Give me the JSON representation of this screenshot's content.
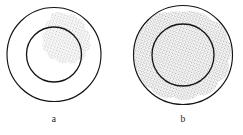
{
  "figure": {
    "type": "scientific-diagram",
    "background_color": "#ffffff",
    "outline_color": "#141414",
    "stipple_color": "#7a7a7a",
    "panels": [
      {
        "id": "panel-a",
        "label": "a",
        "label_x": 54,
        "label_y": 122,
        "outer_circle": {
          "cx": 54,
          "cy": 54.5,
          "r": 47.5
        },
        "inner_circle": {
          "cx": 54,
          "cy": 54.5,
          "r": 27.5
        },
        "stipple": {
          "present": true,
          "extent": "small irregular patch in the upper-right, straddling the inner circle boundary and the annulus",
          "density": "medium"
        }
      },
      {
        "id": "panel-b",
        "label": "b",
        "label_x": 183,
        "label_y": 122,
        "outer_circle": {
          "cx": 183,
          "cy": 55,
          "r": 50
        },
        "inner_circle": {
          "cx": 183,
          "cy": 55,
          "r": 31
        },
        "stipple": {
          "present": true,
          "extent": "large irregular blob filling most of the inner disc and much of the annulus",
          "density": "medium"
        }
      }
    ]
  }
}
